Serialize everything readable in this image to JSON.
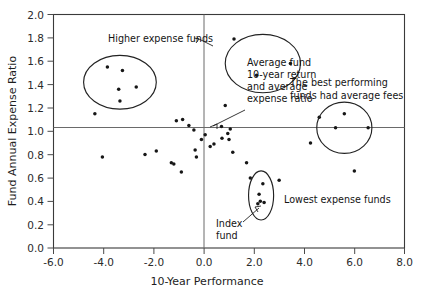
{
  "chart_data": {
    "type": "scatter",
    "title": "",
    "xlabel": "10-Year Performance",
    "ylabel": "Fund Annual Expense Ratio",
    "xlim": [
      -6.0,
      8.0
    ],
    "ylim": [
      0.0,
      2.0
    ],
    "xticks": [
      "-6.0",
      "-4.0",
      "-2.0",
      "0.0",
      "2.0",
      "4.0",
      "6.0",
      "8.0"
    ],
    "xtick_values": [
      -6.0,
      -4.0,
      -2.0,
      0.0,
      2.0,
      4.0,
      6.0,
      8.0
    ],
    "yticks": [
      "0.0",
      "0.2",
      "0.4",
      "0.6",
      "0.8",
      "1.0",
      "1.2",
      "1.4",
      "1.6",
      "1.8",
      "2.0"
    ],
    "ytick_values": [
      0.0,
      0.2,
      0.4,
      0.6,
      0.8,
      1.0,
      1.2,
      1.4,
      1.6,
      1.8,
      2.0
    ],
    "grid": false,
    "legend": "none",
    "reference_lines": [
      {
        "name": "average-10-year-return",
        "orientation": "vertical",
        "value": 0.0
      },
      {
        "name": "average-expense-ratio",
        "orientation": "horizontal",
        "value": 1.03
      }
    ],
    "marker_color": "#161616",
    "points": [
      {
        "x": -4.35,
        "y": 1.15
      },
      {
        "x": -3.85,
        "y": 1.55
      },
      {
        "x": -3.25,
        "y": 1.52
      },
      {
        "x": -3.4,
        "y": 1.36
      },
      {
        "x": -2.7,
        "y": 1.38
      },
      {
        "x": -3.35,
        "y": 1.26
      },
      {
        "x": -4.05,
        "y": 0.78
      },
      {
        "x": -2.35,
        "y": 0.8
      },
      {
        "x": -1.9,
        "y": 0.83
      },
      {
        "x": -1.3,
        "y": 0.73
      },
      {
        "x": -1.2,
        "y": 0.72
      },
      {
        "x": -1.1,
        "y": 1.09
      },
      {
        "x": -0.9,
        "y": 0.65
      },
      {
        "x": -0.85,
        "y": 1.1
      },
      {
        "x": -0.6,
        "y": 1.05
      },
      {
        "x": -0.4,
        "y": 1.01
      },
      {
        "x": -0.35,
        "y": 0.84
      },
      {
        "x": -0.3,
        "y": 0.78
      },
      {
        "x": -0.1,
        "y": 0.93
      },
      {
        "x": 0.05,
        "y": 0.97
      },
      {
        "x": 0.25,
        "y": 0.87
      },
      {
        "x": 0.4,
        "y": 0.89
      },
      {
        "x": 0.7,
        "y": 1.04
      },
      {
        "x": 0.72,
        "y": 0.94
      },
      {
        "x": 0.95,
        "y": 0.98
      },
      {
        "x": 1.0,
        "y": 0.93
      },
      {
        "x": 1.05,
        "y": 1.02
      },
      {
        "x": 1.15,
        "y": 0.82
      },
      {
        "x": 1.7,
        "y": 0.73
      },
      {
        "x": 1.85,
        "y": 0.6
      },
      {
        "x": 2.2,
        "y": 0.46
      },
      {
        "x": 2.25,
        "y": 0.4
      },
      {
        "x": 2.35,
        "y": 0.55
      },
      {
        "x": 2.4,
        "y": 0.39
      },
      {
        "x": 2.15,
        "y": 0.38
      },
      {
        "x": 3.0,
        "y": 0.58
      },
      {
        "x": 1.2,
        "y": 1.79
      },
      {
        "x": 2.1,
        "y": 1.48
      },
      {
        "x": 3.45,
        "y": 1.58
      },
      {
        "x": 4.6,
        "y": 1.12
      },
      {
        "x": 5.6,
        "y": 1.15
      },
      {
        "x": 5.25,
        "y": 1.03
      },
      {
        "x": 6.55,
        "y": 1.03
      },
      {
        "x": 4.25,
        "y": 0.9
      },
      {
        "x": 6.0,
        "y": 0.66
      },
      {
        "x": 0.85,
        "y": 1.22
      }
    ],
    "annotations": [
      {
        "name": "higher-expense-funds",
        "text": "Higher expense funds",
        "target": "upper-right-ellipse"
      },
      {
        "name": "average-fund-note",
        "text": "Average fund\n10-year return\nand average\nexpense ratio",
        "lines": [
          "Average fund",
          "10-year return",
          "and average",
          "expense ratio"
        ],
        "target": "axis-crossing"
      },
      {
        "name": "best-performing-funds",
        "text": "The best performing\nfunds had average fees",
        "lines": [
          "The best performing",
          "funds had average fees"
        ],
        "target": "right-ellipse"
      },
      {
        "name": "lowest-expense-funds",
        "text": "Lowest expense funds",
        "target": "lower-ellipse"
      },
      {
        "name": "index-fund",
        "text": "Index\nfund",
        "lines": [
          "Index",
          "fund"
        ],
        "target": "lower-ellipse-point"
      }
    ],
    "ellipses": [
      {
        "name": "high-expense-cluster",
        "cx": -3.35,
        "cy": 1.42,
        "rx": 1.45,
        "ry": 0.23
      },
      {
        "name": "upper-right-cluster",
        "cx": 2.35,
        "cy": 1.58,
        "rx": 1.5,
        "ry": 0.25
      },
      {
        "name": "average-fee-top-performers",
        "cx": 5.6,
        "cy": 1.03,
        "rx": 1.1,
        "ry": 0.22
      },
      {
        "name": "lowest-expense-cluster",
        "cx": 2.28,
        "cy": 0.45,
        "rx": 0.5,
        "ry": 0.21
      }
    ]
  }
}
